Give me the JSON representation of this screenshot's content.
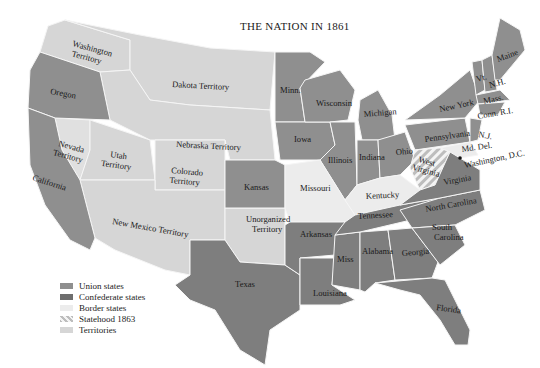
{
  "title": "THE NATION IN 1861",
  "colors": {
    "union": "#8f8f8f",
    "confederate": "#7e7e7e",
    "border": "#ececec",
    "statehood_1863": "#dcdcdc",
    "territories": "#d6d6d6",
    "boundary": "#f5f5f5",
    "text": "#1a1a1a"
  },
  "legend": [
    {
      "key": "union",
      "label": "Union states"
    },
    {
      "key": "confederate",
      "label": "Confederate states"
    },
    {
      "key": "border",
      "label": "Border states"
    },
    {
      "key": "statehood_1863",
      "label": "Statehood 1863"
    },
    {
      "key": "territories",
      "label": "Territories"
    }
  ],
  "labels": {
    "washington": [
      "Washington",
      "Territory"
    ],
    "oregon": "Oregon",
    "dakota": "Dakota Territory",
    "nebraska": "Nebraska Territory",
    "nevada": [
      "Nevada",
      "Territory"
    ],
    "utah": [
      "Utah",
      "Territory"
    ],
    "colorado": [
      "Colorado",
      "Territory"
    ],
    "california": "California",
    "new_mexico": "New Mexico Territory",
    "kansas": "Kansas",
    "unorganized": [
      "Unorganized",
      "Territory"
    ],
    "texas": "Texas",
    "minn": "Minn.",
    "iowa": "Iowa",
    "wisconsin": "Wisconsin",
    "michigan": "Michigan",
    "illinois": "Illinois",
    "indiana": "Indiana",
    "ohio": "Ohio",
    "missouri": "Missouri",
    "kentucky": "Kentucky",
    "tennessee": "Tennessee",
    "arkansas": "Arkansas",
    "louisiana": "Louisiana",
    "miss": "Miss",
    "alabama": "Alabama",
    "georgia": "Georgia",
    "florida": "Florida",
    "south_carolina": [
      "South",
      "Carolina"
    ],
    "north_carolina": "North Carolina",
    "virginia": "Virginia",
    "west_virginia": [
      "West",
      "Virginia"
    ],
    "pennsylvania": "Pennsylvania",
    "new_york": "New York",
    "vt": "Vt.",
    "nh": "N.H.",
    "maine": "Maine",
    "mass": "Mass.",
    "conn_ri": "Conn. R.I.",
    "nj": "N.J.",
    "md_del": "Md. Del.",
    "dc": "Washington, D.C."
  }
}
